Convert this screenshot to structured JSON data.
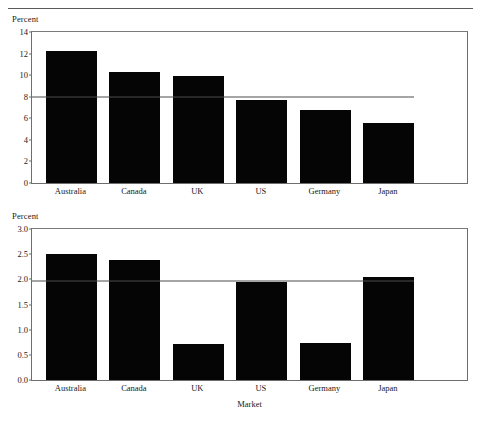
{
  "figure": {
    "rule_top": "horizontal-rule",
    "rule_bottom": "horizontal-rule"
  },
  "chart_data": [
    {
      "type": "bar",
      "panel": "top",
      "title": "",
      "xlabel": "",
      "ylabel": "Percent",
      "categories": [
        "Australia",
        "Canada",
        "UK",
        "US",
        "Germany",
        "Japan"
      ],
      "values": [
        12.2,
        10.3,
        9.95,
        7.7,
        6.8,
        5.6
      ],
      "ylim": [
        0,
        14
      ],
      "yticks": [
        "0",
        "2",
        "4",
        "6",
        "8",
        "10",
        "12",
        "14"
      ],
      "ytick_values": [
        0,
        2,
        4,
        6,
        8,
        10,
        12,
        14
      ],
      "reference_line": 7.95,
      "reference_line_label": "8",
      "grid": false,
      "legend": "none",
      "bar_color": "#050505",
      "axis_color": "#6e6e6e"
    },
    {
      "type": "bar",
      "panel": "bottom",
      "title": "",
      "xlabel": "Market",
      "ylabel": "Percent",
      "categories": [
        "Australia",
        "Canada",
        "UK",
        "US",
        "Germany",
        "Japan"
      ],
      "values": [
        2.5,
        2.38,
        0.72,
        1.95,
        0.73,
        2.05
      ],
      "ylim": [
        0,
        3.0
      ],
      "yticks": [
        "0.0",
        "0.5",
        "1.0",
        "1.5",
        "2.0",
        "2.5",
        "3.0"
      ],
      "ytick_values": [
        0,
        0.5,
        1.0,
        1.5,
        2.0,
        2.5,
        3.0
      ],
      "reference_line": 1.97,
      "reference_line_label": "2.0",
      "grid": false,
      "legend": "none",
      "bar_color": "#050505",
      "axis_color": "#6e6e6e"
    }
  ]
}
